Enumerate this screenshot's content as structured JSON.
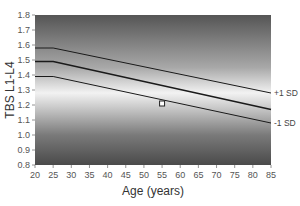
{
  "chart_data": {
    "type": "line",
    "title": "",
    "xlabel": "Age (years)",
    "ylabel": "TBS L1-L4",
    "xlim": [
      20,
      85
    ],
    "ylim": [
      0.8,
      1.8
    ],
    "x_ticks": [
      20,
      25,
      30,
      35,
      40,
      45,
      50,
      55,
      60,
      65,
      70,
      75,
      80,
      85
    ],
    "y_ticks": [
      0.8,
      0.9,
      1.0,
      1.1,
      1.2,
      1.3,
      1.4,
      1.5,
      1.6,
      1.7,
      1.8
    ],
    "x": [
      20,
      25,
      85
    ],
    "series": [
      {
        "name": "+1 SD",
        "values": [
          1.58,
          1.58,
          1.28
        ]
      },
      {
        "name": "Mean",
        "values": [
          1.49,
          1.49,
          1.17
        ]
      },
      {
        "name": "-1 SD",
        "values": [
          1.39,
          1.39,
          1.08
        ]
      }
    ],
    "points": [
      {
        "name": "patient",
        "x": 55,
        "y": 1.21,
        "marker": "square"
      }
    ],
    "annotations": [
      "+1 SD",
      "-1 SD"
    ],
    "background": "grayscale gradient, lightest near mean curve, darker toward top and bottom",
    "grid": false,
    "legend": "none"
  },
  "labels": {
    "xlabel": "Age (years)",
    "ylabel": "TBS L1-L4",
    "plus_sd": "+1 SD",
    "minus_sd": "-1 SD"
  },
  "colors": {
    "line": "#1a1a1a",
    "marker_fill": "#ffffff",
    "marker_edge": "#222222",
    "dark": "#4a4a4a",
    "light": "#f4f4f4"
  }
}
